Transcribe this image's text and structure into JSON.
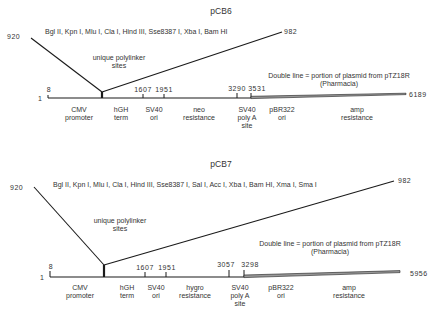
{
  "maps": [
    {
      "title": "pCB6",
      "polylinker_left": "920",
      "polylinker_right": "982",
      "restriction_sites": "Bgl II, Kpn I, Mlu I, Cla I, Hind III, Sse8387 I, Xba I, Bam HI",
      "polylinker_label": [
        "unique polylinker",
        "sites"
      ],
      "legend": [
        "Double line = portion of plasmid from pTZ18R",
        "(Pharmacia)"
      ],
      "start": "1",
      "end": "6189",
      "ticks": [
        "8",
        "1607",
        "1951",
        "3290",
        "3531"
      ],
      "features": [
        [
          "CMV",
          "promoter"
        ],
        [
          "hGH",
          "term"
        ],
        [
          "SV40",
          "ori"
        ],
        [
          "neo",
          "resistance"
        ],
        [
          "SV40",
          "poly A",
          "site"
        ],
        [
          "pBR322",
          "ori"
        ],
        [
          "amp",
          "resistance"
        ]
      ]
    },
    {
      "title": "pCB7",
      "polylinker_left": "920",
      "polylinker_right": "982",
      "restriction_sites": "Bgl II, Kpn I, Mlu I, Cla I, Hind III, Sse8387 I, Sal I, Acc I, Xba I, Bam HI, Xma I, Sma I",
      "polylinker_label": [
        "unique polylinker",
        "sites"
      ],
      "legend": [
        "Double line = portion of plasmid from pTZ18R",
        "(Pharmacia)"
      ],
      "start": "1",
      "end": "5956",
      "ticks": [
        "8",
        "1607",
        "1951",
        "3057",
        "3298"
      ],
      "features": [
        [
          "CMV",
          "promoter"
        ],
        [
          "hGH",
          "term"
        ],
        [
          "SV40",
          "ori"
        ],
        [
          "hygro",
          "resistance"
        ],
        [
          "SV40",
          "poly A",
          "site"
        ],
        [
          "pBR322",
          "ori"
        ],
        [
          "amp",
          "resistance"
        ]
      ]
    }
  ],
  "colors": {
    "line": "#1a1a1a",
    "text": "#333333",
    "double_line_fill": "#9a9a9a"
  }
}
